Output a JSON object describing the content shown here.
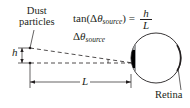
{
  "labels": {
    "dust_line1": "Dust",
    "dust_line2": "particles",
    "equation_prefix": "tan(Δ",
    "equation_theta": "θ",
    "equation_sub": "source",
    "equation_suffix": ") =",
    "equation_numerator": "h",
    "equation_denominator": "L",
    "delta_theta": "Δ",
    "delta_theta_symbol": "θ",
    "delta_theta_sub": "source",
    "h": "h",
    "L": "L",
    "retina": "Retina"
  },
  "colors": {
    "stroke": "#231f20",
    "iris_gray": "#9d9fa2",
    "pupil_black": "#000000",
    "background": "#ffffff"
  }
}
